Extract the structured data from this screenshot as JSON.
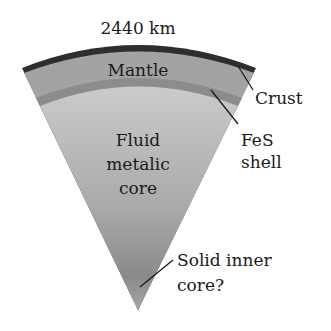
{
  "diagram": {
    "radius_label": "2440 km",
    "layers": [
      {
        "id": "crust",
        "label": "Crust",
        "color": "#2e2e2e"
      },
      {
        "id": "mantle",
        "label": "Mantle",
        "color": "#a3a3a3"
      },
      {
        "id": "fes-shell",
        "label_lines": [
          "FeS",
          "shell"
        ],
        "color": "#8c8c8c"
      },
      {
        "id": "fluid-core",
        "label_lines": [
          "Fluid",
          "metalic",
          "core"
        ],
        "color_top": "#c9c9c9",
        "color_bottom": "#8a8a8a"
      },
      {
        "id": "inner-core",
        "label_lines": [
          "Solid inner",
          "core?"
        ],
        "color": "#7a7a7a"
      }
    ]
  }
}
